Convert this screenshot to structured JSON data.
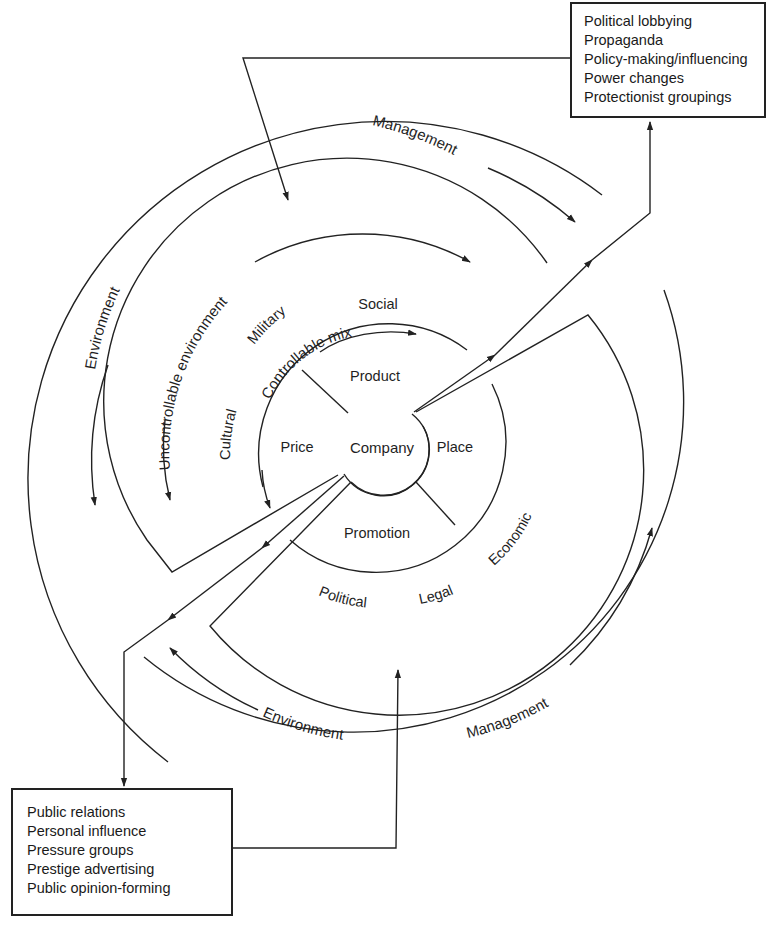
{
  "diagram": {
    "center": {
      "label": "Company"
    },
    "controllable_mix": {
      "title": "Controllable mix",
      "segments": [
        "Product",
        "Place",
        "Promotion",
        "Price"
      ]
    },
    "uncontrollable_environment": {
      "title": "Uncontrollable environment",
      "factors": [
        "Social",
        "Military",
        "Cultural",
        "Economic",
        "Legal",
        "Political"
      ]
    },
    "outer_ring": {
      "labels": {
        "environment_left": "Environment",
        "management_top": "Management",
        "environment_bottom": "Environment",
        "management_bottom": "Management"
      }
    },
    "outbound_box": {
      "items": [
        "Political lobbying",
        "Propaganda",
        "Policy-making/influencing",
        "Power changes",
        "Protectionist groupings"
      ]
    },
    "inbound_box": {
      "items": [
        "Public relations",
        "Personal influence",
        "Pressure groups",
        "Prestige advertising",
        "Public opinion-forming"
      ]
    },
    "colors": {
      "line": "#222222",
      "text": "#1f1f1f",
      "background": "#ffffff"
    }
  }
}
